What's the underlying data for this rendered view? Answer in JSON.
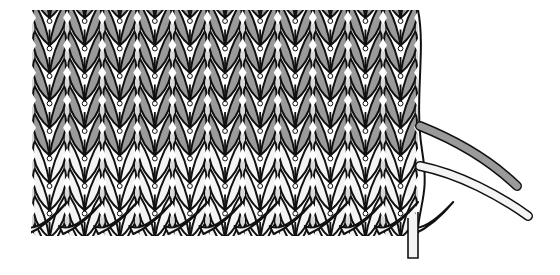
{
  "diagram": {
    "colors": {
      "background": "#ffffff",
      "outline": "#111111",
      "yarn_a": "#9a9a9a",
      "yarn_b": "#f4f4f4",
      "gap": "#ffffff"
    },
    "fabric": {
      "left": 32,
      "right": 418,
      "top": 10,
      "columns": 11,
      "column_width": 35.1,
      "row_height": 27.5,
      "rows_yarn_a": 5,
      "rows_yarn_b": 3
    },
    "cast_on_edge": {
      "y": 208,
      "loops": 11
    },
    "yarn_tails": [
      {
        "name": "yarn-a-tail",
        "color_key": "yarn_a"
      },
      {
        "name": "yarn-b-tail",
        "color_key": "yarn_b"
      }
    ]
  }
}
